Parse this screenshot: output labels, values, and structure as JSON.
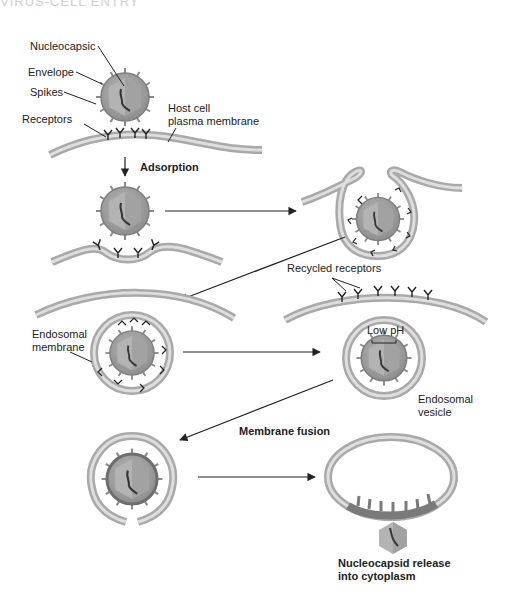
{
  "header": {
    "title": "VIRUS-CELL ENTRY"
  },
  "labels": {
    "nucleocapsid": "Nucleocapsic",
    "envelope": "Envelope",
    "spikes": "Spikes",
    "receptors": "Receptors",
    "host_cell_line1": "Host cell",
    "host_cell_line2": "plasma membrane",
    "adsorption": "Adsorption",
    "recycled_receptors": "Recycled receptors",
    "endosomal_membrane_line1": "Endosomal",
    "endosomal_membrane_line2": "membrane",
    "low_ph": "Low pH",
    "endosomal_vesicle_line1": "Endosomal",
    "endosomal_vesicle_line2": "vesicle",
    "membrane_fusion": "Membrane fusion",
    "release_line1": "Nucleocapsid release",
    "release_line2": "into cytoplasm"
  },
  "steps": [
    {
      "name": "attachment"
    },
    {
      "name": "adsorption"
    },
    {
      "name": "endocytosis"
    },
    {
      "name": "endosome-formation"
    },
    {
      "name": "acidification"
    },
    {
      "name": "membrane-fusion"
    },
    {
      "name": "nucleocapsid-release"
    }
  ],
  "colors": {
    "membrane_outer": "#a9a9a9",
    "membrane_inner": "#d6d6d6",
    "envelope": "#9a9a9a",
    "capsid_light": "#c4c4c4",
    "capsid_dark": "#a6a6a6",
    "ink": "#222222"
  }
}
